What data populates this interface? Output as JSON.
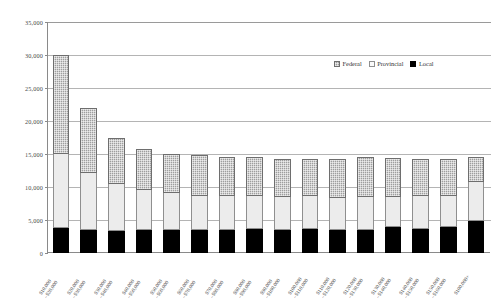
{
  "chart_data": {
    "type": "bar",
    "stacked": true,
    "title": "",
    "subtitle": "",
    "xlabel": "",
    "ylabel": "",
    "ylim": [
      0,
      35000
    ],
    "ytick_step": 5000,
    "ytick_labels": [
      "0",
      "5,000",
      "10,000",
      "15,000",
      "20,000",
      "25,000",
      "30,000",
      "35,000"
    ],
    "ytick_values": [
      0,
      5000,
      10000,
      15000,
      20000,
      25000,
      30000,
      35000
    ],
    "grid": true,
    "grid_axis": "y",
    "legend_position": "top-right",
    "categories": [
      "$10,000–$20,000",
      "$20,000–$30,000",
      "$30,000–$40,000",
      "$40,000–$50,000",
      "$50,000–$60,000",
      "$60,000–$70,000",
      "$70,000–$80,000",
      "$80,000–$90,000",
      "$90,000–$100,000",
      "$100,000–$110,000",
      "$110,000–$120,000",
      "$120,000–$130,000",
      "$130,000–$140,000",
      "$140,000–$150,000",
      "$150,000–$160,000",
      "$100,000+"
    ],
    "category_lines": [
      [
        "$10,000",
        "–$20,000"
      ],
      [
        "$20,000",
        "–$30,000"
      ],
      [
        "$30,000",
        "–$40,000"
      ],
      [
        "$40,000",
        "–$50,000"
      ],
      [
        "$50,000",
        "–$60,000"
      ],
      [
        "$60,000",
        "–$70,000"
      ],
      [
        "$70,000",
        "–$80,000"
      ],
      [
        "$80,000",
        "–$90,000"
      ],
      [
        "$90,000",
        "–$100,000"
      ],
      [
        "$100,000",
        "–$110,000"
      ],
      [
        "$110,000",
        "–$120,000"
      ],
      [
        "$120,000",
        "–$130,000"
      ],
      [
        "$130,000",
        "–$140,000"
      ],
      [
        "$140,000",
        "–$150,000"
      ],
      [
        "$150,000",
        "–$160,000"
      ],
      [
        "$100,000+",
        ""
      ]
    ],
    "series": [
      {
        "name": "Local",
        "color": "#000000",
        "values": [
          3800,
          3500,
          3400,
          3500,
          3500,
          3500,
          3500,
          3600,
          3500,
          3600,
          3500,
          3500,
          3900,
          3600,
          3900,
          4800
        ]
      },
      {
        "name": "Provincial",
        "color": "#ececec",
        "values": [
          11200,
          8700,
          7100,
          6000,
          5600,
          5200,
          5200,
          5100,
          5000,
          5000,
          4900,
          5000,
          4600,
          5100,
          4700,
          6000
        ]
      },
      {
        "name": "Federal",
        "color": "#9e9e9e",
        "values": [
          15000,
          9700,
          6900,
          6200,
          5900,
          6100,
          5900,
          5800,
          5700,
          5600,
          5900,
          6000,
          5900,
          5600,
          5600,
          3700
        ]
      }
    ],
    "totals": [
      30000,
      21900,
      17400,
      15700,
      15000,
      14800,
      14600,
      14500,
      14200,
      14200,
      14300,
      14500,
      14400,
      14300,
      14200,
      14500
    ]
  },
  "legend": {
    "items": [
      {
        "label": "Federal",
        "key": "federal"
      },
      {
        "label": "Provincial",
        "key": "provincial"
      },
      {
        "label": "Local",
        "key": "local"
      }
    ]
  }
}
